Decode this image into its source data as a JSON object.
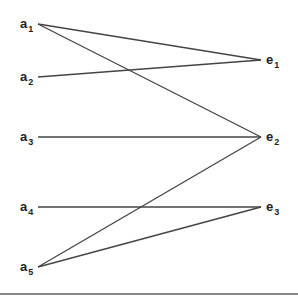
{
  "diagram": {
    "type": "bipartite-graph",
    "line_color": "#444444",
    "left_nodes": [
      {
        "id": "a1",
        "base": "a",
        "sub": "1",
        "x": 38,
        "y": 24,
        "label_x": 20,
        "label_y": 17
      },
      {
        "id": "a2",
        "base": "a",
        "sub": "2",
        "x": 38,
        "y": 77,
        "label_x": 20,
        "label_y": 70
      },
      {
        "id": "a3",
        "base": "a",
        "sub": "3",
        "x": 38,
        "y": 137,
        "label_x": 20,
        "label_y": 130
      },
      {
        "id": "a4",
        "base": "a",
        "sub": "4",
        "x": 38,
        "y": 207,
        "label_x": 20,
        "label_y": 200
      },
      {
        "id": "a5",
        "base": "a",
        "sub": "5",
        "x": 38,
        "y": 267,
        "label_x": 20,
        "label_y": 260
      }
    ],
    "right_nodes": [
      {
        "id": "e1",
        "base": "e",
        "sub": "1",
        "x": 261,
        "y": 60,
        "label_x": 266,
        "label_y": 53
      },
      {
        "id": "e2",
        "base": "e",
        "sub": "2",
        "x": 261,
        "y": 137,
        "label_x": 266,
        "label_y": 130
      },
      {
        "id": "e3",
        "base": "e",
        "sub": "3",
        "x": 261,
        "y": 207,
        "label_x": 266,
        "label_y": 200
      }
    ],
    "edges": [
      {
        "from": "a1",
        "to": "e1"
      },
      {
        "from": "a1",
        "to": "e2"
      },
      {
        "from": "a2",
        "to": "e1"
      },
      {
        "from": "a3",
        "to": "e2"
      },
      {
        "from": "a4",
        "to": "e3"
      },
      {
        "from": "a5",
        "to": "e2"
      },
      {
        "from": "a5",
        "to": "e3"
      }
    ]
  }
}
